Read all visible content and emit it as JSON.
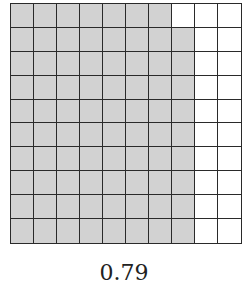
{
  "diagram": {
    "type": "hundred-grid",
    "rows": 10,
    "columns": 10,
    "shaded_per_row": [
      7,
      8,
      8,
      8,
      8,
      8,
      8,
      8,
      8,
      8
    ],
    "shaded_total": 79,
    "colors": {
      "shaded": "#d2d2d2",
      "unshaded": "#ffffff",
      "line": "#2a2a2a"
    }
  },
  "caption": {
    "label": "0.79"
  }
}
